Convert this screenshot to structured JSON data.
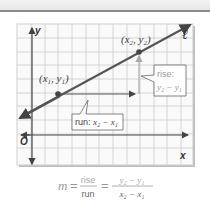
{
  "diagram": {
    "line_label": "ℓ",
    "axes": {
      "x_label": "x",
      "y_label": "y",
      "origin_label": "O"
    },
    "point1": {
      "label_x": "x",
      "label_x_sub": "1",
      "label_y": "y",
      "label_y_sub": "1"
    },
    "point2": {
      "label_x": "x",
      "label_x_sub": "2",
      "label_y": "y",
      "label_y_sub": "2"
    },
    "rise_callout": {
      "title": "rise:",
      "expr": "y₂ − y₁"
    },
    "run_callout": {
      "title": "run:",
      "expr": "x₂ − x₁"
    }
  },
  "formula": {
    "lhs": "m",
    "eq1": "=",
    "frac1_num": "rise",
    "frac1_den": "run",
    "eq2": "=",
    "frac2_num": "y₂ − y₁",
    "frac2_den": "x₂ − x₁"
  },
  "colors": {
    "line": "#555555",
    "grid": "#c8c8c8",
    "callout_text": "#999999",
    "text": "#333333"
  }
}
